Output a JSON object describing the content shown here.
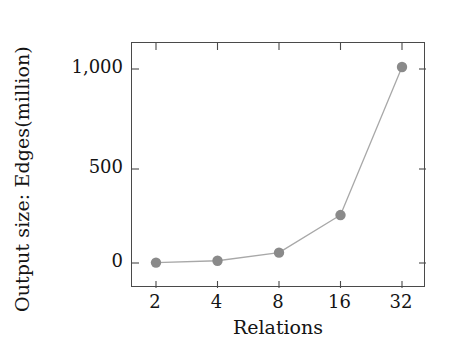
{
  "chart_data": {
    "type": "line",
    "title": "",
    "xlabel": "Relations",
    "ylabel": "Output size: Edges(million)",
    "x": [
      2,
      4,
      8,
      16,
      32
    ],
    "xtick_labels": [
      "2",
      "4",
      "8",
      "16",
      "32"
    ],
    "xscale": "log2",
    "values": [
      2,
      12,
      55,
      255,
      1010
    ],
    "series": [
      {
        "name": "Output size",
        "values": [
          2,
          12,
          55,
          255,
          1010
        ]
      }
    ],
    "ytick_labels": [
      "0",
      "500",
      "1,000"
    ],
    "ytick_values": [
      0,
      500,
      1000
    ],
    "ylim": [
      -30,
      1120
    ],
    "xlim_log2": [
      0.85,
      5.5
    ],
    "grid": false,
    "legend": "none",
    "marker": "circle",
    "marker_color": "#8a8a8a",
    "line_color": "#a8a8a8",
    "axis_color": "#4a4a4a"
  }
}
